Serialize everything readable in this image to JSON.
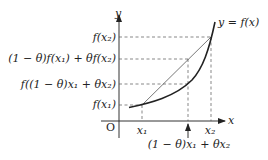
{
  "figure": {
    "type": "convex-function-illustration",
    "axes": {
      "x_label": "x",
      "y_label": "y",
      "origin_label": "O"
    },
    "curve_label": "y = f(x)",
    "y_labels": {
      "f_x2": "f(x₂)",
      "chord_value": "(1 − θ)f(x₁) + θf(x₂)",
      "f_mid": "f((1 − θ)x₁ + θx₂)",
      "f_x1": "f(x₁)"
    },
    "x_labels": {
      "x1": "x₁",
      "x2": "x₂",
      "mid": "(1 − θ)x₁ + θx₂"
    },
    "colors": {
      "curve": "#222222",
      "axis": "#333333",
      "dashed": "#555555",
      "chord": "#555555"
    }
  }
}
